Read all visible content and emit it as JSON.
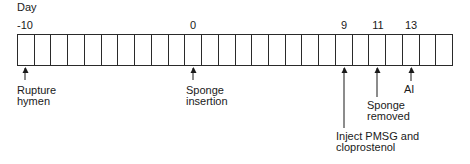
{
  "diagram": {
    "axis_title": "Day",
    "day_start": -10,
    "day_end": 15,
    "cell_count": 26,
    "labeled_days": [
      {
        "day": -10,
        "label": "-10"
      },
      {
        "day": 0,
        "label": "0"
      },
      {
        "day": 9,
        "label": "9"
      },
      {
        "day": 11,
        "label": "11"
      },
      {
        "day": 13,
        "label": "13"
      }
    ],
    "events": [
      {
        "day": -10,
        "label": "Rupture\nhymen"
      },
      {
        "day": 0,
        "label": "Sponge\ninsertion"
      },
      {
        "day": 9,
        "label": "Inject PMSG and\ncloprostenol"
      },
      {
        "day": 11,
        "label": "Sponge\nremoved"
      },
      {
        "day": 13,
        "label": "AI"
      }
    ],
    "colors": {
      "line": "#2a2a2a",
      "text": "#1a1a1a",
      "background": "#ffffff"
    }
  }
}
